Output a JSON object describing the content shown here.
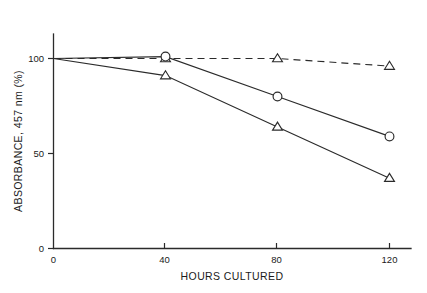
{
  "chart_data": {
    "type": "line",
    "title": "",
    "xlabel": "HOURS CULTURED",
    "ylabel": "ABSORBANCE, 457 nm (%)",
    "x": [
      0,
      40,
      80,
      120
    ],
    "xlim": [
      0,
      128
    ],
    "ylim": [
      0,
      112
    ],
    "xticks": [
      0,
      40,
      80,
      120
    ],
    "xtick_labels": [
      "0",
      "40",
      "80",
      "120"
    ],
    "yticks": [
      0,
      50,
      100
    ],
    "ytick_labels": [
      "0",
      "50",
      "100"
    ],
    "grid": false,
    "legend": "none",
    "series": [
      {
        "name": "control",
        "marker": "triangle",
        "linestyle": "dashed",
        "color": "#2b2b2b",
        "values": [
          100,
          100,
          100,
          96
        ]
      },
      {
        "name": "moderate-decline",
        "marker": "circle",
        "linestyle": "solid",
        "color": "#2b2b2b",
        "values": [
          100,
          101,
          80,
          59
        ]
      },
      {
        "name": "steep-decline",
        "marker": "triangle",
        "linestyle": "solid",
        "color": "#2b2b2b",
        "values": [
          100,
          91,
          64,
          37
        ]
      }
    ]
  },
  "axes": {
    "x_title": "HOURS CULTURED",
    "y_title": "ABSORBANCE, 457 nm (%)",
    "x_tick_0": "0",
    "x_tick_1": "40",
    "x_tick_2": "80",
    "x_tick_3": "120",
    "y_tick_0": "0",
    "y_tick_1": "50",
    "y_tick_2": "100"
  },
  "colors": {
    "ink": "#2b2b2b",
    "background": "#ffffff",
    "marker_fill": "#ffffff"
  }
}
